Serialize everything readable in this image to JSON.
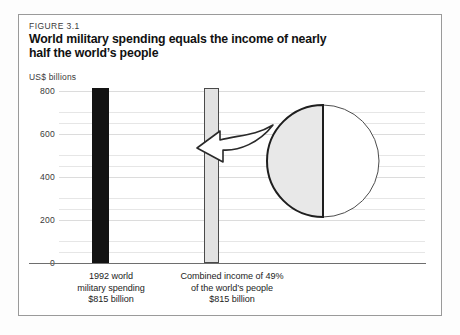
{
  "figure": {
    "number_label": "FIGURE 3.1",
    "title_line1": "World military spending equals the income of nearly",
    "title_line2": "half the world’s people",
    "unit_label": "US$ billions"
  },
  "chart_data": {
    "type": "bar",
    "title": "World military spending equals the income of nearly half the world’s people",
    "subtitle": "FIGURE 3.1",
    "xlabel": "",
    "ylabel": "US$ billions",
    "ylim": [
      0,
      800
    ],
    "yticks": [
      0,
      200,
      400,
      600,
      800
    ],
    "ytick_labels": [
      "0",
      "200",
      "400",
      "600",
      "800"
    ],
    "minor_gridline_step": 50,
    "grid": true,
    "legend": "none",
    "categories": [
      "1992 world military spending",
      "Combined income of 49% of the world’s people"
    ],
    "values": [
      815,
      815
    ],
    "value_labels": [
      "$815 billion",
      "$815 billion"
    ],
    "bar_colors": [
      "#131313",
      "#e2e2e2"
    ],
    "annotation": "Arrow from the shaded 49% half of the world population circle to the combined-income bar",
    "pie": {
      "type": "pie",
      "title": "World’s people",
      "labels": [
        "Poorest 49% of the world’s people",
        "Remaining 51%"
      ],
      "values": [
        49,
        51
      ],
      "colors": [
        "#e8e8e8",
        "#ffffff"
      ],
      "orientation": "vertical split, shaded half on the left"
    }
  },
  "yaxis": {
    "ticks": [
      {
        "label": "800",
        "value": 800
      },
      {
        "label": "600",
        "value": 600
      },
      {
        "label": "400",
        "value": 400
      },
      {
        "label": "200",
        "value": 200
      },
      {
        "label": "0",
        "value": 0
      }
    ]
  },
  "bars": [
    {
      "name": "military-spending",
      "value": 815,
      "caption_line1": "1992 world",
      "caption_line2": "military spending",
      "caption_line3": "$815 billion"
    },
    {
      "name": "combined-income",
      "value": 815,
      "caption_line1": "Combined income of 49%",
      "caption_line2": "of the world’s people",
      "caption_line3": "$815 billion"
    }
  ],
  "colors": {
    "bar_military": "#131313",
    "bar_income": "#e2e2e2",
    "bar_income_outline": "#4a4a4a",
    "pie_shaded": "#e8e8e8",
    "pie_unshaded": "#ffffff",
    "grid": "#e6e6e6",
    "axis": "#6e6e6e",
    "frame": "#9a9a9a",
    "text": "#1c1c1c"
  }
}
